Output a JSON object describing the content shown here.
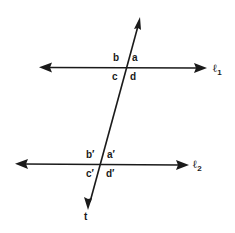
{
  "diagram": {
    "colors": {
      "line": "#1a1a1a",
      "background": "#ffffff"
    },
    "lines": {
      "l1": {
        "name": "ℓ",
        "subscript": "1"
      },
      "l2": {
        "name": "ℓ",
        "subscript": "2"
      },
      "transversal": {
        "name": "t"
      }
    },
    "angles_l1": {
      "a": "a",
      "b": "b",
      "c": "c",
      "d": "d"
    },
    "angles_l2": {
      "a": "a′",
      "b": "b′",
      "c": "c′",
      "d": "d′"
    }
  }
}
